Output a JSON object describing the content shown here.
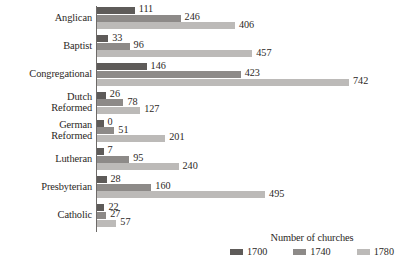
{
  "chart_data": {
    "type": "bar",
    "orientation": "horizontal",
    "title": "",
    "xlabel": "",
    "ylabel": "",
    "grid": false,
    "legend_position": "bottom-right",
    "legend_title": "Number of churches",
    "xlim": [
      0,
      742
    ],
    "categories": [
      "Anglican",
      "Baptist",
      "Congregational",
      "Dutch\nReformed",
      "German\nReformed",
      "Lutheran",
      "Presbyterian",
      "Catholic"
    ],
    "series": [
      {
        "name": "1700",
        "color": "#5e5b59",
        "values": [
          111,
          33,
          146,
          26,
          0,
          7,
          28,
          22
        ]
      },
      {
        "name": "1740",
        "color": "#8d8a88",
        "values": [
          246,
          96,
          423,
          78,
          51,
          95,
          160,
          27
        ]
      },
      {
        "name": "1780",
        "color": "#bcbab8",
        "values": [
          406,
          457,
          742,
          127,
          201,
          240,
          495,
          57
        ]
      }
    ]
  },
  "legend": {
    "title": "Number of churches",
    "entries": [
      {
        "label": "1700",
        "color": "#5e5b59"
      },
      {
        "label": "1740",
        "color": "#8d8a88"
      },
      {
        "label": "1780",
        "color": "#bcbab8"
      }
    ]
  },
  "colors": {
    "axis": "#6d6a68",
    "text": "#2b2725",
    "background": "#ffffff"
  }
}
